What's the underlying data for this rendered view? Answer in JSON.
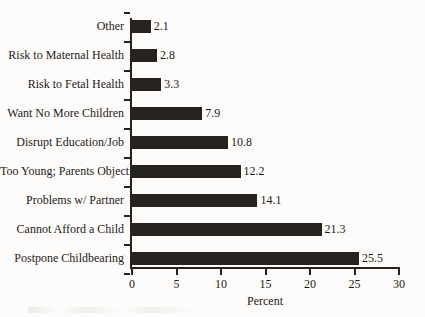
{
  "chart_data": {
    "type": "bar",
    "orientation": "horizontal",
    "title": "",
    "xlabel": "Percent",
    "ylabel": "",
    "xlim": [
      0,
      30
    ],
    "xticks": [
      0,
      5,
      10,
      15,
      20,
      25,
      30
    ],
    "grid": false,
    "legend": null,
    "bar_color": "#262220",
    "background_color": "#fdfcfa",
    "categories": [
      "Other",
      "Risk to Maternal Health",
      "Risk to Fetal Health",
      "Want No More Children",
      "Disrupt Education/Job",
      "Too Young; Parents Object",
      "Problems w/ Partner",
      "Cannot Afford a Child",
      "Postpone Childbearing"
    ],
    "values": [
      2.1,
      2.8,
      3.3,
      7.9,
      10.8,
      12.2,
      14.1,
      21.3,
      25.5
    ],
    "value_labels": [
      "2.1",
      "2.8",
      "3.3",
      "7.9",
      "10.8",
      "12.2",
      "14.1",
      "21.3",
      "25.5"
    ],
    "xtick_labels": [
      "0",
      "5",
      "10",
      "15",
      "20",
      "25",
      "30"
    ]
  }
}
